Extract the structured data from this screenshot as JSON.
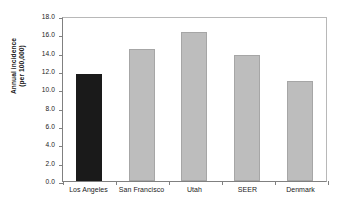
{
  "chart_data": {
    "type": "bar",
    "title": "",
    "xlabel": "",
    "ylabel": "Annual incidence (per 100,000)",
    "ylabel_line1": "Annual incidence",
    "ylabel_line2": "(per 100,000)",
    "categories": [
      "Los Angeles",
      "San Francisco",
      "Utah",
      "SEER",
      "Denmark"
    ],
    "values": [
      11.7,
      14.35,
      16.3,
      13.75,
      10.95
    ],
    "bar_colors": [
      "#1a1a1a",
      "#bdbdbd",
      "#bdbdbd",
      "#bdbdbd",
      "#bdbdbd"
    ],
    "highlight_category": "Los Angeles",
    "ylim": [
      0.0,
      18.0
    ],
    "ytick_step": 2.0,
    "ytick_labels": [
      "18.0",
      "16.0",
      "14.0",
      "12.0",
      "10.0",
      "8.0",
      "6.0",
      "4.0",
      "2.0",
      "0.0"
    ],
    "ytick_values": [
      18.0,
      16.0,
      14.0,
      12.0,
      10.0,
      8.0,
      6.0,
      4.0,
      2.0,
      0.0
    ],
    "grid": false,
    "legend": null,
    "legend_position": "none",
    "annotations": []
  },
  "colors": {
    "axis": "#808080",
    "frame_light": "#b8b8b8",
    "bar_grey": "#bdbdbd",
    "bar_grey_border": "#a6a6a6",
    "bar_black": "#1a1a1a",
    "text": "#1a1a1a",
    "background": "#ffffff"
  }
}
